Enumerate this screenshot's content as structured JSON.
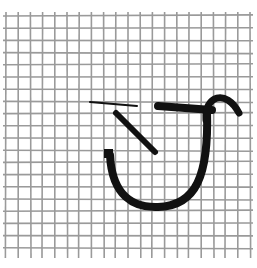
{
  "image": {
    "description": "Wire mesh grid with black ink strokes forming an abstract hook/U-shaped glyph",
    "background_color": "#ffffff",
    "mesh_color": "#9a9a9a",
    "ink_color": "#111111",
    "grid": {
      "x_start": 6,
      "x_end": 250,
      "y_start": 12,
      "y_end": 258,
      "spacing": 12.2
    },
    "strokes": [
      {
        "name": "thin-horizontal-line",
        "d": "M90 102 L137 106",
        "width": 2
      },
      {
        "name": "diagonal-stroke",
        "d": "M116 113 L155 152",
        "width": 6
      },
      {
        "name": "thick-horizontal-bar",
        "d": "M158 106 L212 110",
        "width": 8
      },
      {
        "name": "hook-arc",
        "d": "M206 120 C204 96 226 88 239 113",
        "width": 7
      },
      {
        "name": "u-curve",
        "d": "M110 155 C112 196 134 208 158 207 C196 206 209 176 207 110",
        "width": 8
      }
    ],
    "square_cap": {
      "x": 104,
      "y": 149,
      "w": 9,
      "h": 9
    }
  }
}
